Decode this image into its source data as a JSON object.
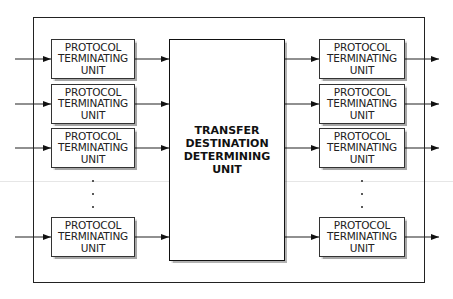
{
  "diagram": {
    "central_unit": {
      "lines": [
        "TRANSFER",
        "DESTINATION",
        "DETERMINING",
        "UNIT"
      ]
    },
    "left_units": [
      {
        "lines": [
          "PROTOCOL",
          "TERMINATING",
          "UNIT"
        ]
      },
      {
        "lines": [
          "PROTOCOL",
          "TERMINATING",
          "UNIT"
        ]
      },
      {
        "lines": [
          "PROTOCOL",
          "TERMINATING",
          "UNIT"
        ]
      },
      {
        "lines": [
          "PROTOCOL",
          "TERMINATING",
          "UNIT"
        ]
      }
    ],
    "right_units": [
      {
        "lines": [
          "PROTOCOL",
          "TERMINATING",
          "UNIT"
        ]
      },
      {
        "lines": [
          "PROTOCOL",
          "TERMINATING",
          "UNIT"
        ]
      },
      {
        "lines": [
          "PROTOCOL",
          "TERMINATING",
          "UNIT"
        ]
      },
      {
        "lines": [
          "PROTOCOL",
          "TERMINATING",
          "UNIT"
        ]
      }
    ],
    "ellipsis": "⋮",
    "colors": {
      "line": "#222222",
      "box_border": "#333333",
      "background": "#ffffff"
    }
  }
}
